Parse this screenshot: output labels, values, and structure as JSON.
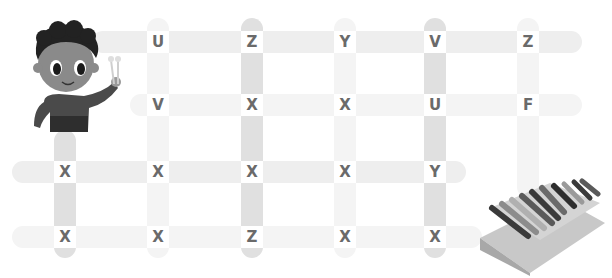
{
  "game": {
    "type": "letter-maze-puzzle",
    "palette": {
      "background": "#ffffff",
      "bar_medium": "#e0e0e0",
      "bar_light": "#eeeeee",
      "letter": "#6a6a6a"
    },
    "columns_x": [
      65,
      158,
      252,
      345,
      435,
      528
    ],
    "rows_y": [
      42,
      105,
      172,
      237
    ],
    "grid": [
      {
        "row": 0,
        "letters": [
          {
            "col": 1,
            "letter": "U"
          },
          {
            "col": 2,
            "letter": "Z"
          },
          {
            "col": 3,
            "letter": "Y"
          },
          {
            "col": 4,
            "letter": "V"
          },
          {
            "col": 5,
            "letter": "Z"
          }
        ]
      },
      {
        "row": 1,
        "letters": [
          {
            "col": 1,
            "letter": "V"
          },
          {
            "col": 2,
            "letter": "X"
          },
          {
            "col": 3,
            "letter": "X"
          },
          {
            "col": 4,
            "letter": "U"
          },
          {
            "col": 5,
            "letter": "F"
          }
        ]
      },
      {
        "row": 2,
        "letters": [
          {
            "col": 0,
            "letter": "X"
          },
          {
            "col": 1,
            "letter": "X"
          },
          {
            "col": 2,
            "letter": "X"
          },
          {
            "col": 3,
            "letter": "X"
          },
          {
            "col": 4,
            "letter": "Y"
          }
        ]
      },
      {
        "row": 3,
        "letters": [
          {
            "col": 0,
            "letter": "X"
          },
          {
            "col": 1,
            "letter": "X"
          },
          {
            "col": 2,
            "letter": "Z"
          },
          {
            "col": 3,
            "letter": "X"
          },
          {
            "col": 4,
            "letter": "X"
          }
        ]
      }
    ],
    "start_character": "boy-holding-mallets-icon",
    "goal_object": "xylophone-icon"
  }
}
